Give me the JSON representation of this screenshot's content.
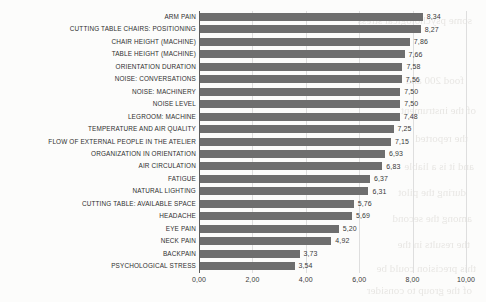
{
  "chart_data": {
    "type": "bar",
    "orientation": "horizontal",
    "title": "",
    "xlabel": "",
    "ylabel": "",
    "xlim": [
      0,
      10
    ],
    "grid": true,
    "legend": false,
    "decimal_separator": ",",
    "bar_color": "#6e6e6e",
    "categories": [
      "ARM PAIN",
      "CUTTING TABLE CHAIRS: POSITIONING",
      "CHAIR HEIGHT (MACHINE)",
      "TABLE HEIGHT (MACHINE)",
      "ORIENTATION DURATION",
      "NOISE: CONVERSATIONS",
      "NOISE: MACHINERY",
      "NOISE LEVEL",
      "LEGROOM: MACHINE",
      "TEMPERATURE AND AIR QUALITY",
      "FLOW OF EXTERNAL PEOPLE IN THE ATELIER",
      "ORGANIZATION IN ORIENTATION",
      "AIR CIRCULATION",
      "FATIGUE",
      "NATURAL LIGHTING",
      "CUTTING TABLE: AVAILABLE SPACE",
      "HEADACHE",
      "EYE PAIN",
      "NECK PAIN",
      "BACKPAIN",
      "PSYCHOLOGICAL STRESS"
    ],
    "values": [
      8.34,
      8.27,
      7.86,
      7.66,
      7.58,
      7.56,
      7.5,
      7.5,
      7.48,
      7.25,
      7.15,
      6.93,
      6.83,
      6.37,
      6.31,
      5.76,
      5.69,
      5.2,
      4.92,
      3.73,
      3.54
    ],
    "value_labels": [
      "8,34",
      "8,27",
      "7,86",
      "7,66",
      "7,58",
      "7,56",
      "7,50",
      "7,50",
      "7,48",
      "7,25",
      "7,15",
      "6,93",
      "6,83",
      "6,37",
      "6,31",
      "5,76",
      "5,69",
      "5,20",
      "4,92",
      "3,73",
      "3,54"
    ],
    "xticks": [
      0,
      2,
      4,
      6,
      8,
      10
    ],
    "xtick_labels": [
      "0,00",
      "2,00",
      "4,00",
      "6,00",
      "8,00",
      "10,00"
    ]
  },
  "background_bleed": [
    {
      "text": "some psychological stress",
      "x": 14,
      "y": 14,
      "size": 11
    },
    {
      "text": "food 200 and",
      "x": 22,
      "y": 74,
      "size": 11
    },
    {
      "text": "of the instrument",
      "x": 10,
      "y": 104,
      "size": 11
    },
    {
      "text": "the reported",
      "x": 18,
      "y": 132,
      "size": 11
    },
    {
      "text": "and it is a liable",
      "x": 12,
      "y": 160,
      "size": 11
    },
    {
      "text": "during the pilot",
      "x": 20,
      "y": 186,
      "size": 11
    },
    {
      "text": "among the second",
      "x": 14,
      "y": 212,
      "size": 11
    },
    {
      "text": "the results in the",
      "x": 16,
      "y": 238,
      "size": 11
    },
    {
      "text": "this precision could be",
      "x": 10,
      "y": 262,
      "size": 11
    },
    {
      "text": "of the group to consider",
      "x": 14,
      "y": 284,
      "size": 11
    }
  ]
}
